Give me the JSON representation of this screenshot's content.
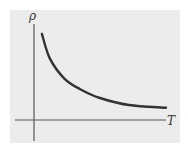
{
  "chart_data": {
    "type": "line",
    "title": "",
    "xlabel": "T",
    "ylabel": "ρ",
    "grid": false,
    "legend": null,
    "ticks": {
      "x": [],
      "y": []
    },
    "series": [
      {
        "name": "ρ(T)",
        "points_normalized": [
          {
            "x": 0.06,
            "y": 0.98
          },
          {
            "x": 0.12,
            "y": 0.7
          },
          {
            "x": 0.23,
            "y": 0.47
          },
          {
            "x": 0.35,
            "y": 0.35
          },
          {
            "x": 0.5,
            "y": 0.25
          },
          {
            "x": 0.72,
            "y": 0.17
          },
          {
            "x": 1.0,
            "y": 0.14
          }
        ]
      }
    ],
    "xlim": [
      0,
      1
    ],
    "ylim": [
      0,
      1
    ]
  },
  "colors": {
    "panel_background": "#ececec",
    "axis": "#555555",
    "curve": "#333333"
  }
}
